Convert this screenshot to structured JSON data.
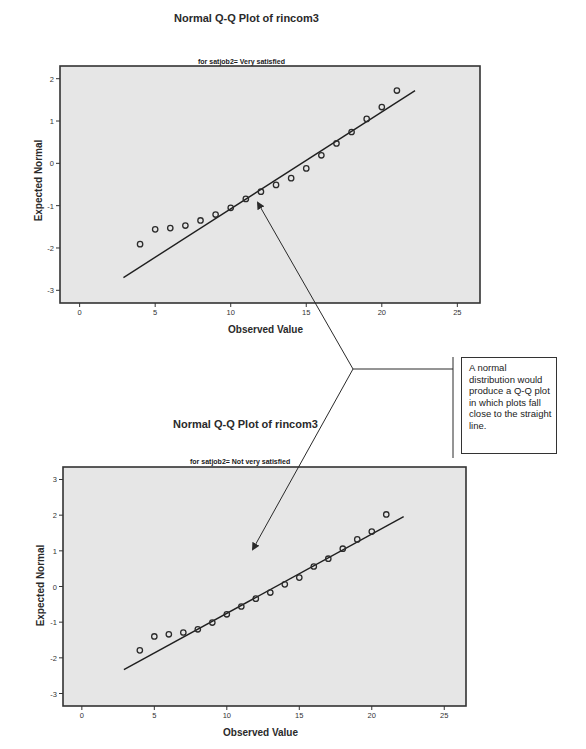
{
  "chart_data": [
    {
      "type": "scatter",
      "title": "Normal Q-Q Plot of rincom3",
      "subtitle": "for satjob2= Very satisfied",
      "xlabel": "Observed Value",
      "ylabel": "Expected Normal",
      "xlim": [
        -1.3,
        26.5
      ],
      "ylim": [
        -3.3,
        2.3
      ],
      "xticks": [
        0,
        5,
        10,
        15,
        20,
        25
      ],
      "yticks": [
        2,
        1,
        0,
        -1,
        -2,
        -3
      ],
      "grid": false,
      "x": [
        4,
        5,
        6,
        7,
        8,
        9,
        10,
        11,
        12,
        13,
        14,
        15,
        16,
        17,
        18,
        19,
        20,
        21
      ],
      "y": [
        -1.91,
        -1.56,
        -1.53,
        -1.47,
        -1.35,
        -1.21,
        -1.05,
        -0.84,
        -0.67,
        -0.51,
        -0.35,
        -0.12,
        0.19,
        0.47,
        0.74,
        1.05,
        1.33,
        1.72
      ],
      "reference_line": {
        "x": [
          2.9,
          22.2
        ],
        "y": [
          -2.7,
          1.72
        ]
      }
    },
    {
      "type": "scatter",
      "title": "Normal Q-Q Plot of rincom3",
      "subtitle": "for satjob2= Not very satisfied",
      "xlabel": "Observed Value",
      "ylabel": "Expected Normal",
      "xlim": [
        -1.3,
        26.5
      ],
      "ylim": [
        -3.35,
        3.35
      ],
      "xticks": [
        0,
        5,
        10,
        15,
        20,
        25
      ],
      "yticks": [
        3,
        2,
        1,
        0,
        -1,
        -2,
        -3
      ],
      "grid": false,
      "x": [
        4,
        5,
        6,
        7,
        8,
        9,
        10,
        11,
        12,
        13,
        14,
        15,
        16,
        17,
        18,
        19,
        20,
        21
      ],
      "y": [
        -1.79,
        -1.4,
        -1.34,
        -1.29,
        -1.2,
        -1.01,
        -0.78,
        -0.56,
        -0.34,
        -0.17,
        0.06,
        0.25,
        0.56,
        0.78,
        1.06,
        1.32,
        1.54,
        2.02
      ],
      "reference_line": {
        "x": [
          2.9,
          22.2
        ],
        "y": [
          -2.33,
          1.96
        ]
      }
    }
  ],
  "annotation": {
    "text": "A normal distribution would produce a Q-Q plot in which plots fall close to the straight line."
  },
  "colors": {
    "plot_bg": "#e6e6e6",
    "frame": "#333333",
    "marker": "#2b2b2b",
    "line": "#1f1f1f"
  }
}
